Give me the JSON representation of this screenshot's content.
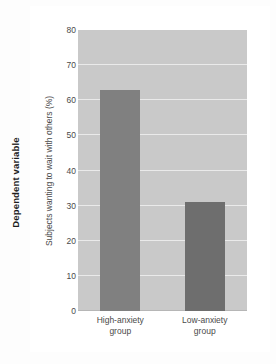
{
  "figure": {
    "outer_caption": "Dependent variable"
  },
  "colors": {
    "page_background": "#fdfdfd",
    "card_background": "#ffffff",
    "plot_background": "#c9c9c9",
    "gridline": "#eaeaea",
    "baseline": "#b6b6b6",
    "text": "#4a4a4a",
    "caption_text": "#1d1d1d",
    "bar_high_anxiety": "#808080",
    "bar_low_anxiety": "#6e6e6e"
  },
  "chart_data": {
    "type": "bar",
    "title": "",
    "xlabel": "",
    "ylabel": "Subjects wanting to wait with others (%)",
    "categories": [
      "High-anxiety group",
      "Low-anxiety group"
    ],
    "category_lines": [
      [
        "High-anxiety",
        "group"
      ],
      [
        "Low-anxiety",
        "group"
      ]
    ],
    "values": [
      63,
      31
    ],
    "ylim": [
      0,
      80
    ],
    "ytick_step": 10,
    "yticks": [
      0,
      10,
      20,
      30,
      40,
      50,
      60,
      70,
      80
    ],
    "ytick_labels": [
      "0",
      "10",
      "20",
      "30",
      "40",
      "50",
      "60",
      "70",
      "80"
    ],
    "bar_colors": [
      "#808080",
      "#6e6e6e"
    ],
    "grid": true,
    "legend": "none"
  }
}
